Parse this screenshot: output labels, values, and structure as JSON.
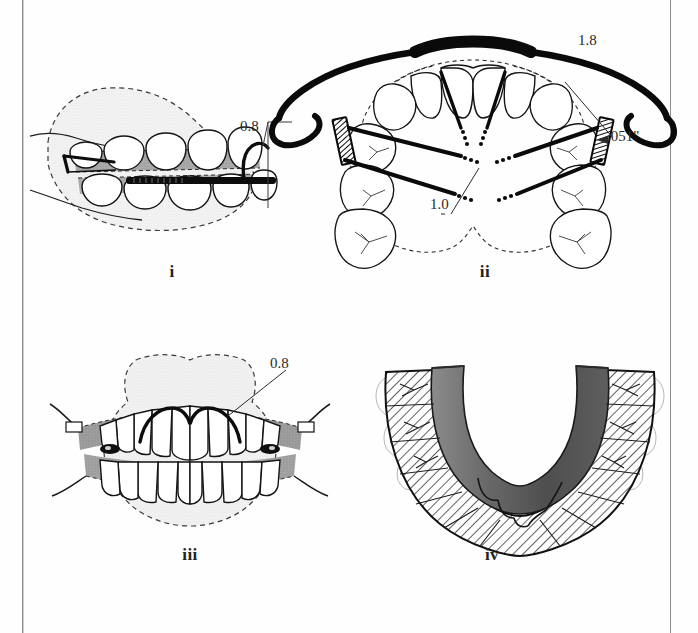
{
  "figure": {
    "kind": "line-drawing-figure",
    "background_color": "#fefefe",
    "ink_color": "#111111"
  },
  "page_rules": {
    "left_rule_color": "#8d8d8d",
    "right_rule_color": "#8d8d8d"
  },
  "panels": [
    {
      "id": "i",
      "caption": "i",
      "view": "lateral view of dentition with appliance",
      "labels": [
        {
          "text": "0.8",
          "meaning": "0.8 mm wire",
          "name": "label-0-8-panel-i"
        }
      ],
      "shading": {
        "soft_tissue_fill": "#efefef",
        "appliance_fill": "#9a9a9a",
        "wire_fill": "#111111"
      }
    },
    {
      "id": "ii",
      "caption": "ii",
      "view": "occlusal view of maxillary arch with facebow and expansion springs",
      "labels": [
        {
          "text": "1.8",
          "meaning": "1.8 mm outer bow",
          "name": "label-1-8"
        },
        {
          "text": ".051\"",
          "meaning": ".051 inch tube",
          "name": "label-051-inch"
        },
        {
          "text": "1.0",
          "meaning": "1.0 mm spring wire",
          "name": "label-1-0"
        }
      ],
      "shading": {
        "tooth_outline": "#222222",
        "dashed_outline": "#333333",
        "wire_fill": "#0a0a0a"
      }
    },
    {
      "id": "iii",
      "caption": "iii",
      "view": "frontal view of dentition in occlusion with labial arch",
      "labels": [
        {
          "text": "0.8",
          "meaning": "0.8 mm labial bow",
          "name": "label-0-8-panel-iii"
        }
      ],
      "shading": {
        "soft_tissue_fill": "#eeeeee",
        "appliance_fill": "#8f8f8f",
        "wire_fill": "#111111"
      }
    },
    {
      "id": "iv",
      "caption": "iv",
      "view": "occlusal view of mandibular arch with acrylic base plate",
      "labels": [],
      "shading": {
        "acrylic_fill": "#5a5a5a",
        "hatch_color": "#1d1d1d",
        "hatch_background": "#ffffff"
      }
    }
  ],
  "measurement_values": {
    "wire_08": "0.8",
    "outer_bow_18": "1.8",
    "tube_051": ".051\"",
    "spring_10": "1.0"
  }
}
